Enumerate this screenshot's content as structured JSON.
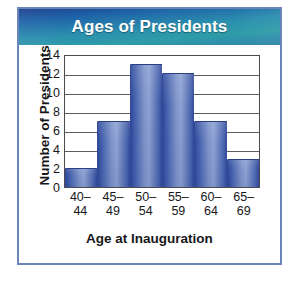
{
  "chart_data": {
    "type": "bar",
    "title": "Ages of Presidents",
    "xlabel": "Age at Inauguration",
    "ylabel": "Number of Presidents",
    "categories": [
      "40–\n44",
      "45–\n49",
      "50–\n54",
      "55–\n59",
      "60–\n64",
      "65–\n69"
    ],
    "values": [
      2,
      7,
      13,
      12,
      7,
      3
    ],
    "ylim": [
      0,
      14
    ],
    "yticks": [
      14,
      12,
      10,
      8,
      6,
      4,
      2,
      0
    ],
    "grid": "horizontal",
    "legend": "none",
    "bins": [
      {
        "range": "40–44",
        "count": 2
      },
      {
        "range": "45–49",
        "count": 7
      },
      {
        "range": "50–54",
        "count": 13
      },
      {
        "range": "55–59",
        "count": 12
      },
      {
        "range": "60–64",
        "count": 7
      },
      {
        "range": "65–69",
        "count": 3
      }
    ]
  },
  "style": {
    "banner_start": "#1b3f8f",
    "banner_end": "#2e9ca8",
    "bar_color": "#7d93c9",
    "bar_edge": "#2f4a9c",
    "card_border": "#6a86b8",
    "axis_color": "#4a4a50",
    "text_color": "#17171a"
  }
}
